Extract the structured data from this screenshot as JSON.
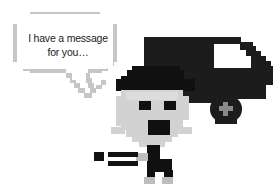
{
  "scene": {
    "width": 275,
    "height": 195,
    "background_color": "#ffffff",
    "style": "pixel-art illustration"
  },
  "speech_bubble": {
    "name": "speech-bubble",
    "line1": "I have a message",
    "line2": "for you…",
    "text": "I have a message\nfor you…",
    "border_color": "#c6c6c6",
    "fill_color": "#ffffff",
    "text_color": "#1a1a1a",
    "tail_direction": "down-right"
  },
  "truck": {
    "name": "delivery-truck",
    "body_color": "#1c1c1c",
    "window_color": "#ffffff",
    "wheel_color": "#1c1c1c",
    "wheel_hub_color": "#8a8a8a",
    "hub_symbol": "plus",
    "facing": "right"
  },
  "character": {
    "name": "running-messenger",
    "hat_color": "#101010",
    "face_color": "#d2d2d2",
    "eye_color": "#101010",
    "mouth_color": "#101010",
    "body_color": "#101010",
    "accent_color": "#bdbdbd",
    "pose": "running",
    "expression": "open-mouth-surprised"
  },
  "motion_lines": {
    "name": "motion-lines",
    "color": "#121212",
    "count": 3
  }
}
